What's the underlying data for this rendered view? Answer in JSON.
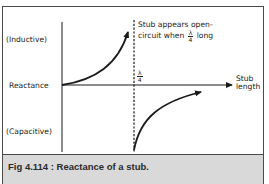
{
  "diagram": {
    "y_axis_labels": {
      "top": "(Inductive)",
      "middle": "Reactance",
      "bottom": "(Capacitive)"
    },
    "x_axis_label": {
      "line1": "Stub",
      "line2": "length"
    },
    "quarter_wave_marker": {
      "numerator": "λ",
      "denominator": "4"
    },
    "annotation": {
      "line1": "Stub appears open-",
      "line2_prefix": "circuit when",
      "fraction_numerator": "λ",
      "fraction_denominator": "4",
      "line2_suffix": "long"
    },
    "curves": [
      {
        "name": "inductive-branch",
        "region": "0 to λ/4",
        "sign": "positive",
        "behavior": "rises toward +infinity approaching λ/4"
      },
      {
        "name": "capacitive-branch",
        "region": "after λ/4",
        "sign": "negative",
        "behavior": "rises from -infinity toward zero after λ/4"
      }
    ],
    "colors": {
      "line": "#1a1a1a",
      "border": "#4a4a4a",
      "caption_bg": "#d9d9d9",
      "background": "#ffffff"
    }
  },
  "caption": {
    "text": "Fig 4.114 : Reactance of a stub."
  }
}
